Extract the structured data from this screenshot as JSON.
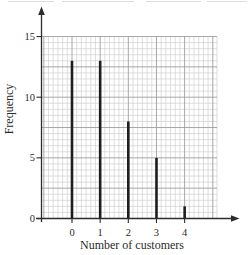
{
  "figure": {
    "background": "#ffffff"
  },
  "chart_data": {
    "type": "bar",
    "title": "",
    "xlabel": "Number of customers",
    "ylabel": "Frequency",
    "categories": [
      "0",
      "1",
      "2",
      "3",
      "4"
    ],
    "values": [
      13,
      13,
      8,
      5,
      1
    ],
    "series": [
      {
        "name": "Frequency",
        "values": [
          13,
          13,
          8,
          5,
          1
        ]
      }
    ],
    "x_tick_labels": [
      "0",
      "1",
      "2",
      "3",
      "4"
    ],
    "y_tick_labels": [
      "0",
      "5",
      "10",
      "15"
    ],
    "y_tick_values": [
      0,
      5,
      10,
      15
    ],
    "ylim": [
      0,
      15
    ],
    "xlim": [
      -1.1,
      5.15
    ],
    "grid": {
      "style": "fine-graph-paper",
      "minor_x_divisions_per_unit": 6,
      "minor_y_step": 0.5,
      "major_x_step": 1,
      "major_y_step": 2.5,
      "visible": true
    },
    "legend": null,
    "bar_style": "thin-vertical-line",
    "axis_arrows": [
      "up",
      "right"
    ],
    "colors": {
      "bar": "#1d1d1d",
      "axis": "#2c2c2c",
      "grid_minor": "#d0d0d0",
      "grid_major": "#9e9e9e",
      "text": "#2b2b2b",
      "background": "#ffffff",
      "scan_artifact": "#dcdcdc"
    }
  }
}
